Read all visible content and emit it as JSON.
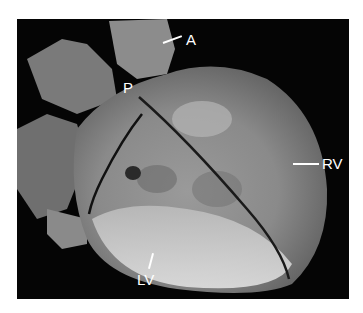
{
  "figure": {
    "background_color": "#050505",
    "labels": [
      {
        "id": "A",
        "text": "A"
      },
      {
        "id": "P",
        "text": "P"
      },
      {
        "id": "RV",
        "text": "RV"
      },
      {
        "id": "LV",
        "text": "LV"
      }
    ]
  }
}
